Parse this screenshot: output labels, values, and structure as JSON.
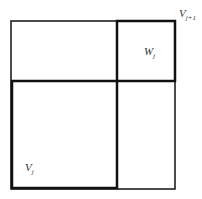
{
  "diagram": {
    "labels": {
      "v_next": {
        "base": "V",
        "sub": "j+1"
      },
      "w": {
        "base": "W",
        "sub": "j"
      },
      "v": {
        "base": "V",
        "sub": "j"
      }
    },
    "colors": {
      "line": "#111111",
      "background": "#ffffff"
    }
  }
}
